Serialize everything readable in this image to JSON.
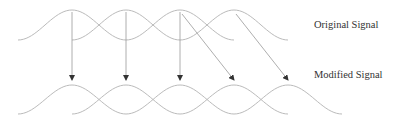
{
  "labels": {
    "original": "Original Signal",
    "modified": "Modified Signal"
  },
  "diagram": {
    "type": "overlap-add signal windows",
    "top_row": {
      "window_count": 4,
      "peak_xs": [
        72,
        126,
        180,
        234
      ],
      "peak_y": 10,
      "base_y": 40,
      "half_width": 54
    },
    "bottom_row": {
      "window_count": 5,
      "peak_xs": [
        72,
        126,
        180,
        234,
        288
      ],
      "peak_y": 85,
      "base_y": 114,
      "half_width": 54
    },
    "arrows": [
      {
        "from": [
          72,
          12
        ],
        "to": [
          72,
          80
        ]
      },
      {
        "from": [
          126,
          12
        ],
        "to": [
          126,
          80
        ]
      },
      {
        "from": [
          180,
          12
        ],
        "to": [
          180,
          80
        ]
      },
      {
        "from": [
          182,
          14
        ],
        "to": [
          234,
          80
        ]
      },
      {
        "from": [
          236,
          14
        ],
        "to": [
          288,
          80
        ]
      }
    ],
    "colors": {
      "curve": "#bbbbbb",
      "arrow": "#999999",
      "arrowhead": "#333333"
    }
  }
}
